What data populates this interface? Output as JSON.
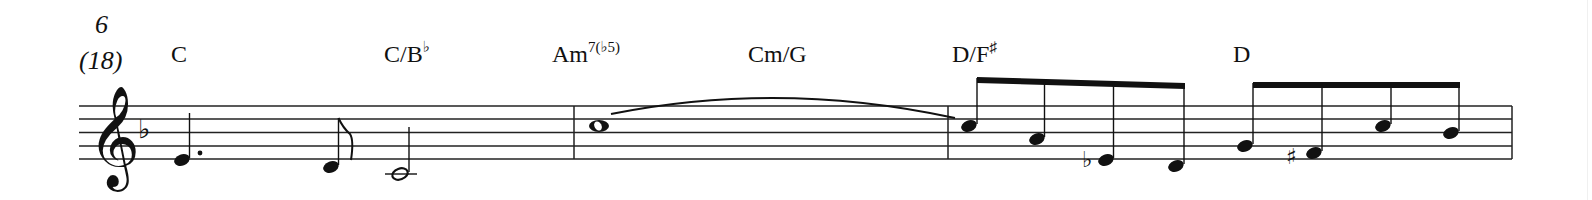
{
  "score": {
    "measure_number": "6",
    "measure_number_alt": "(18)",
    "clef": "treble",
    "key_signature": "F major (1 flat: B♭)",
    "chords": [
      {
        "root": "C",
        "ext": ""
      },
      {
        "root": "C/B",
        "ext": "♭"
      },
      {
        "root": "Am",
        "ext": "7(♭5)"
      },
      {
        "root": "Cm/G",
        "ext": ""
      },
      {
        "root": "D/F",
        "ext": "♯"
      },
      {
        "root": "D",
        "ext": ""
      }
    ],
    "measures": [
      {
        "notes": [
          "E4 dotted-quarter",
          "D4 eighth",
          "C4 half"
        ]
      },
      {
        "notes": [
          "C5 whole (tied)"
        ]
      },
      {
        "notes": [
          "C5 eighth",
          "A4 eighth",
          "E♭4 eighth",
          "D4 eighth"
        ]
      },
      {
        "notes": [
          "G4 eighth",
          "F♯4 eighth",
          "C5 eighth",
          "B♭4 eighth"
        ]
      }
    ],
    "colors": {
      "ink": "#111111",
      "background": "#ffffff"
    }
  }
}
